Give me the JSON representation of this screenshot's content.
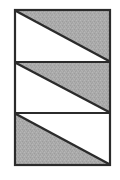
{
  "figure": {
    "title": "Three-band diagonal shading figure",
    "canvas": {
      "width": 120,
      "height": 180,
      "background": "#ffffff"
    },
    "box": {
      "x": 15,
      "y": 10,
      "width": 95,
      "height": 155,
      "fill": "#ffffff",
      "stroke": "#2b2b2b",
      "stroke_width": 2
    },
    "dividers": [
      {
        "name": "divider-1",
        "y": 62,
        "stroke": "#2b2b2b",
        "stroke_width": 2
      },
      {
        "name": "divider-2",
        "y": 113,
        "stroke": "#2b2b2b",
        "stroke_width": 2
      }
    ],
    "colors": {
      "gray_fill": "#aaaaaa",
      "gray_fill_light": "#b6b6b6",
      "gray_fill_dark": "#9e9e9e",
      "stroke": "#2b2b2b",
      "white_fill": "#ffffff",
      "page_background": "#ffffff"
    },
    "bands": [
      {
        "id": "band-1",
        "label": "Top band",
        "top": 10,
        "bottom": 62,
        "diagonal": {
          "from": "top-left",
          "to": "bottom-right"
        },
        "shaded_half": "upper-right",
        "shaded_polygon": "15,10 110,10 110,62",
        "white_polygon": "15,10 110,62 15,62"
      },
      {
        "id": "band-2",
        "label": "Middle band",
        "top": 62,
        "bottom": 113,
        "diagonal": {
          "from": "top-left",
          "to": "bottom-right"
        },
        "shaded_half": "upper-right",
        "shaded_polygon": "15,62 110,62 110,113",
        "white_polygon": "15,62 110,113 15,113"
      },
      {
        "id": "band-3",
        "label": "Bottom band",
        "top": 113,
        "bottom": 165,
        "diagonal": {
          "from": "top-left",
          "to": "bottom-right"
        },
        "shaded_half": "lower-left",
        "shaded_polygon": "15,113 110,165 15,165",
        "white_polygon": "15,113 110,113 110,165"
      }
    ]
  }
}
